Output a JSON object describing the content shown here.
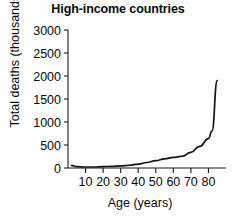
{
  "chart_data": {
    "type": "line",
    "title": "High-income countries",
    "xlabel": "Age (years)",
    "ylabel": "Total deaths (thousands)",
    "xlim": [
      0,
      90
    ],
    "ylim": [
      0,
      3000
    ],
    "grid": false,
    "legend": null,
    "xticks": [
      10,
      20,
      30,
      40,
      50,
      60,
      70,
      80
    ],
    "xtick_labels": [
      "10",
      "20",
      "30",
      "40",
      "50",
      "60",
      "70",
      "80"
    ],
    "yticks": [
      0,
      500,
      1000,
      1500,
      2000,
      2500,
      3000
    ],
    "ytick_labels": [
      "0",
      "500",
      "1000",
      "1500",
      "2000",
      "2500",
      "3000"
    ],
    "line_color": "#141414",
    "background_color": "#fdfdfd",
    "series": [
      {
        "name": "Total deaths",
        "x": [
          2,
          5,
          10,
          15,
          20,
          25,
          30,
          35,
          40,
          45,
          50,
          55,
          60,
          65,
          70,
          75,
          80,
          82,
          85
        ],
        "values": [
          55,
          30,
          22,
          22,
          30,
          35,
          45,
          60,
          85,
          120,
          160,
          200,
          230,
          255,
          340,
          470,
          640,
          800,
          1900
        ]
      }
    ]
  }
}
